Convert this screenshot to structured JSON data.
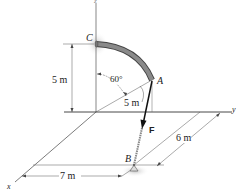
{
  "figure": {
    "axes": {
      "x": "x",
      "y": "y",
      "z": "z"
    },
    "points": {
      "A": "A",
      "B": "B",
      "C": "C"
    },
    "force": {
      "label": "F",
      "color": "#111111"
    },
    "dimensions": {
      "height_CO": "5 m",
      "radius_OA": "5 m",
      "angle": "60°",
      "dist_B_y": "6 m",
      "dist_B_x": "7 m"
    },
    "colors": {
      "rod": "#8a8a8a",
      "rod_edge": "#444444",
      "line": "#333333",
      "support": "#999999"
    }
  }
}
